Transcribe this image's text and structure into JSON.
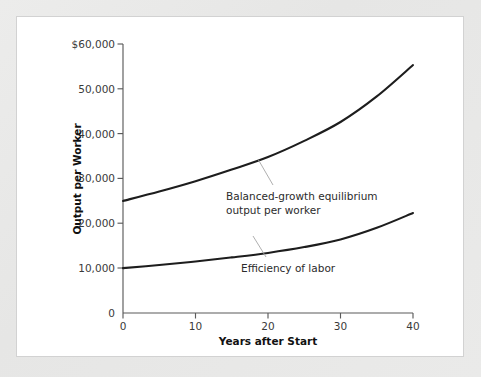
{
  "figure": {
    "background_color": "#e8e8e8",
    "card_color": "#ffffff",
    "line_color": "#1d1d1d",
    "axis_color": "#5b5b5b",
    "leader_color": "#a6a6a6"
  },
  "chart_data": {
    "type": "line",
    "title": "",
    "xlabel": "Years after Start",
    "ylabel": "Output per Worker",
    "xlim": [
      0,
      40
    ],
    "ylim": [
      0,
      60000
    ],
    "grid": false,
    "legend_position": "inline-annotations",
    "xticks": [
      0,
      10,
      20,
      30,
      40
    ],
    "xtick_labels": [
      "0",
      "10",
      "20",
      "30",
      "40"
    ],
    "yticks": [
      0,
      10000,
      20000,
      30000,
      40000,
      50000,
      60000
    ],
    "ytick_labels": [
      "0",
      "10,000",
      "20,000",
      "30,000",
      "40,000",
      "50,000",
      "$60,000"
    ],
    "x": [
      0,
      5,
      10,
      15,
      20,
      25,
      30,
      35,
      40
    ],
    "series": [
      {
        "name": "Balanced-growth equilibrium output per worker",
        "values": [
          25000,
          27100,
          29400,
          32000,
          34800,
          38400,
          42600,
          48300,
          55300
        ]
      },
      {
        "name": "Efficiency of labor",
        "values": [
          10000,
          10700,
          11500,
          12400,
          13400,
          14700,
          16400,
          19000,
          22300
        ]
      }
    ],
    "annotations": [
      {
        "id": "upper-annotation",
        "line1": "Balanced-growth equilibrium",
        "line2": "output per worker"
      },
      {
        "id": "lower-annotation",
        "line1": "Efficiency of labor",
        "line2": ""
      }
    ]
  }
}
